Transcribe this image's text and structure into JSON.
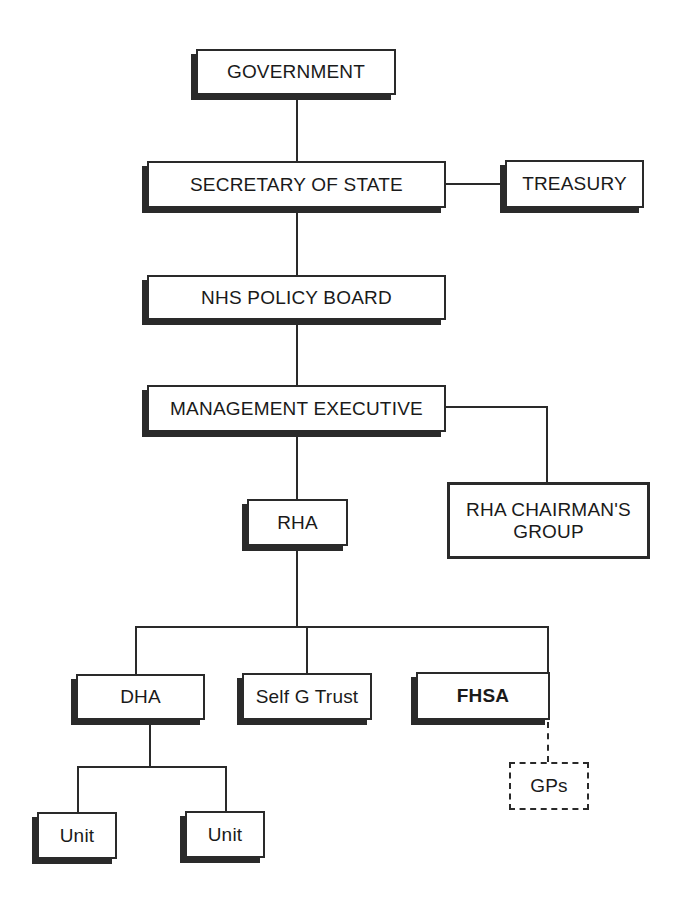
{
  "diagram": {
    "type": "organization-chart",
    "nodes": {
      "government": "GOVERNMENT",
      "secretary_of_state": "SECRETARY OF STATE",
      "treasury": "TREASURY",
      "nhs_policy_board": "NHS POLICY BOARD",
      "management_executive": "MANAGEMENT EXECUTIVE",
      "rha_chairmans_group_line1": "RHA CHAIRMAN'S",
      "rha_chairmans_group_line2": "GROUP",
      "rha": "RHA",
      "dha": "DHA",
      "self_g_trust": "Self G Trust",
      "fhsa": "FHSA",
      "gps": "GPs",
      "unit_1": "Unit",
      "unit_2": "Unit"
    },
    "edges": [
      {
        "from": "GOVERNMENT",
        "to": "SECRETARY OF STATE",
        "style": "solid"
      },
      {
        "from": "SECRETARY OF STATE",
        "to": "TREASURY",
        "style": "solid"
      },
      {
        "from": "SECRETARY OF STATE",
        "to": "NHS POLICY BOARD",
        "style": "solid"
      },
      {
        "from": "NHS POLICY BOARD",
        "to": "MANAGEMENT EXECUTIVE",
        "style": "solid"
      },
      {
        "from": "MANAGEMENT EXECUTIVE",
        "to": "RHA CHAIRMAN'S GROUP",
        "style": "solid"
      },
      {
        "from": "MANAGEMENT EXECUTIVE",
        "to": "RHA",
        "style": "solid"
      },
      {
        "from": "RHA",
        "to": "DHA",
        "style": "solid"
      },
      {
        "from": "RHA",
        "to": "Self G Trust",
        "style": "solid"
      },
      {
        "from": "RHA",
        "to": "FHSA",
        "style": "solid"
      },
      {
        "from": "DHA",
        "to": "Unit",
        "style": "solid"
      },
      {
        "from": "DHA",
        "to": "Unit",
        "style": "solid"
      },
      {
        "from": "FHSA",
        "to": "GPs",
        "style": "dashed"
      }
    ]
  }
}
